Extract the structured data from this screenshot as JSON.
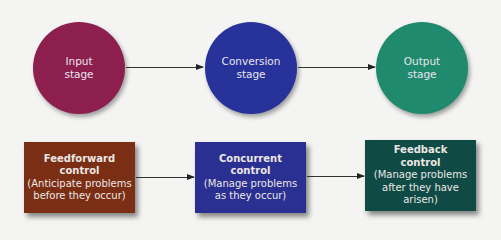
{
  "stages": [
    {
      "id": "input",
      "line1": "Input",
      "line2": "stage",
      "color": "#8c1f4e"
    },
    {
      "id": "conversion",
      "line1": "Conversion",
      "line2": "stage",
      "color": "#27339b"
    },
    {
      "id": "output",
      "line1": "Output",
      "line2": "stage",
      "color": "#1f8a6e"
    }
  ],
  "controls": [
    {
      "id": "feedforward",
      "title1": "Feedforward",
      "title2": "control",
      "desc1": "(Anticipate problems",
      "desc2": "before they occur)",
      "color": "#7a2e14"
    },
    {
      "id": "concurrent",
      "title1": "Concurrent",
      "title2": "control",
      "desc1": "(Manage problems",
      "desc2": "as they occur)",
      "color": "#2a2f92"
    },
    {
      "id": "feedback",
      "title1": "Feedback",
      "title2": "control",
      "desc1": "(Manage problems",
      "desc2": "after they have arisen)",
      "color": "#0f4a45"
    }
  ]
}
